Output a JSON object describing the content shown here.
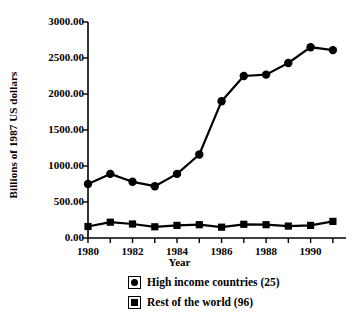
{
  "chart_data": {
    "type": "line",
    "title": "",
    "xlabel": "Year",
    "ylabel": "Billions of 1987 US dollars",
    "x": [
      1980,
      1981,
      1982,
      1983,
      1984,
      1985,
      1986,
      1987,
      1988,
      1989,
      1990,
      1991
    ],
    "xlim": [
      1980,
      1991.5
    ],
    "ylim": [
      0,
      3000
    ],
    "yticks": [
      0,
      500,
      1000,
      1500,
      2000,
      2500,
      3000
    ],
    "ytick_labels": [
      "0.00",
      "500.00",
      "1000.00",
      "1500.00",
      "2000.00",
      "2500.00",
      "3000.00"
    ],
    "xticks": [
      1980,
      1981,
      1982,
      1983,
      1984,
      1985,
      1986,
      1987,
      1988,
      1989,
      1990,
      1991
    ],
    "xtick_labels": [
      {
        "value": 1980,
        "label": "1980"
      },
      {
        "value": 1982,
        "label": "1982"
      },
      {
        "value": 1984,
        "label": "1984"
      },
      {
        "value": 1986,
        "label": "1986"
      },
      {
        "value": 1988,
        "label": "1988"
      },
      {
        "value": 1990,
        "label": "1990"
      }
    ],
    "grid": false,
    "legend_position": "bottom",
    "series": [
      {
        "name": "High income countries (25)",
        "marker": "circle",
        "color": "#000000",
        "values": [
          750,
          890,
          780,
          720,
          890,
          1160,
          1900,
          2250,
          2270,
          2430,
          2650,
          2610
        ]
      },
      {
        "name": "Rest of the world (96)",
        "marker": "square",
        "color": "#000000",
        "values": [
          160,
          220,
          195,
          155,
          175,
          185,
          150,
          190,
          185,
          165,
          175,
          230
        ]
      }
    ]
  },
  "axes": {
    "y_title": "Billions of 1987 US dollars",
    "x_title": "Year"
  },
  "legend": {
    "items": [
      {
        "label": "High income countries (25)",
        "marker": "circle-marker-icon"
      },
      {
        "label": "Rest of the world (96)",
        "marker": "square-marker-icon"
      }
    ]
  }
}
